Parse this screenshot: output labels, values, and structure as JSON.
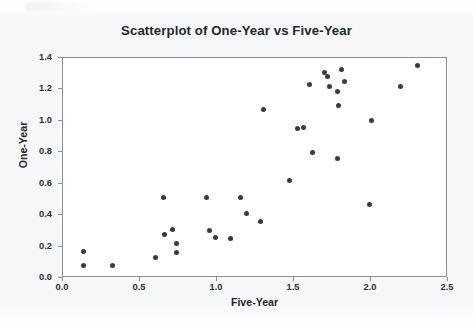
{
  "chart_data": {
    "type": "scatter",
    "title": "Scatterplot of One-Year vs Five-Year",
    "xlabel": "Five-Year",
    "ylabel": "One-Year",
    "xlim": [
      0.0,
      2.5
    ],
    "ylim": [
      0.0,
      1.4
    ],
    "xticks": [
      "0.0",
      "0.5",
      "1.0",
      "1.5",
      "2.0",
      "2.5"
    ],
    "yticks": [
      "0.0",
      "0.2",
      "0.4",
      "0.6",
      "0.8",
      "1.0",
      "1.2",
      "1.4"
    ],
    "xtick_values": [
      0.0,
      0.5,
      1.0,
      1.5,
      2.0,
      2.5
    ],
    "ytick_values": [
      0.0,
      0.2,
      0.4,
      0.6,
      0.8,
      1.0,
      1.2,
      1.4
    ],
    "grid": false,
    "legend": null,
    "marker_color": "#3b3b3f",
    "marker_size": 5,
    "points": [
      {
        "x": 0.13,
        "y": 0.17
      },
      {
        "x": 0.13,
        "y": 0.08
      },
      {
        "x": 0.32,
        "y": 0.08
      },
      {
        "x": 0.6,
        "y": 0.13
      },
      {
        "x": 0.65,
        "y": 0.51
      },
      {
        "x": 0.66,
        "y": 0.28
      },
      {
        "x": 0.71,
        "y": 0.31
      },
      {
        "x": 0.74,
        "y": 0.22
      },
      {
        "x": 0.74,
        "y": 0.16
      },
      {
        "x": 0.93,
        "y": 0.51
      },
      {
        "x": 0.95,
        "y": 0.3
      },
      {
        "x": 0.99,
        "y": 0.26
      },
      {
        "x": 1.09,
        "y": 0.25
      },
      {
        "x": 1.15,
        "y": 0.51
      },
      {
        "x": 1.19,
        "y": 0.41
      },
      {
        "x": 1.28,
        "y": 0.36
      },
      {
        "x": 1.3,
        "y": 1.07
      },
      {
        "x": 1.47,
        "y": 0.62
      },
      {
        "x": 1.52,
        "y": 0.95
      },
      {
        "x": 1.56,
        "y": 0.96
      },
      {
        "x": 1.6,
        "y": 1.23
      },
      {
        "x": 1.62,
        "y": 0.8
      },
      {
        "x": 1.7,
        "y": 1.31
      },
      {
        "x": 1.72,
        "y": 1.28
      },
      {
        "x": 1.73,
        "y": 1.22
      },
      {
        "x": 1.78,
        "y": 1.19
      },
      {
        "x": 1.79,
        "y": 1.1
      },
      {
        "x": 1.78,
        "y": 0.76
      },
      {
        "x": 1.81,
        "y": 1.33
      },
      {
        "x": 1.83,
        "y": 1.25
      },
      {
        "x": 1.99,
        "y": 0.47
      },
      {
        "x": 2.0,
        "y": 1.0
      },
      {
        "x": 2.19,
        "y": 1.22
      },
      {
        "x": 2.3,
        "y": 1.35
      }
    ]
  }
}
